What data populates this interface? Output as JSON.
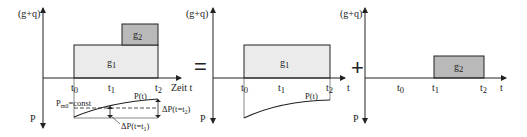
{
  "colors": {
    "g1_fill": "#ebebeb",
    "g2_fill": "#b9b9b9",
    "stroke": "#222222"
  },
  "operators": {
    "equals": "=",
    "plus": "+"
  },
  "panels": [
    {
      "id": "left",
      "y_label_top": "(g+q)",
      "y_label_bottom": "P",
      "x_label": "Zeit t",
      "ticks": {
        "t0": "t",
        "t0_sub": "0",
        "t1": "t",
        "t1_sub": "1",
        "t2": "t",
        "t2_sub": "2"
      },
      "boxes": {
        "g1": "g",
        "g1_sub": "1",
        "g2": "g",
        "g2_sub": "2"
      },
      "prestress": {
        "curve_label": "P(t)",
        "const_label": "P",
        "const_sub": "m0",
        "const_suffix": "=const",
        "delta_t2": "ΔP(t=t",
        "delta_t2_sub": "2",
        "delta_t2_end": ")",
        "delta_t1": "ΔP(t=t",
        "delta_t1_sub": "1",
        "delta_t1_end": ")"
      }
    },
    {
      "id": "middle",
      "y_label_top": "(g+q)",
      "y_label_bottom": "P",
      "x_label": "t",
      "ticks": {
        "t0": "t",
        "t0_sub": "0",
        "t1": "t",
        "t1_sub": "1",
        "t2": "t",
        "t2_sub": "2"
      },
      "boxes": {
        "g1": "g",
        "g1_sub": "1"
      },
      "prestress": {
        "curve_label": "P(t)"
      }
    },
    {
      "id": "right",
      "y_label_top": "(g+q)",
      "y_label_bottom": "P",
      "x_label": "t",
      "ticks": {
        "t0": "t",
        "t0_sub": "0",
        "t1": "t",
        "t1_sub": "1",
        "t2": "t",
        "t2_sub": "2"
      },
      "boxes": {
        "g2": "g",
        "g2_sub": "2"
      }
    }
  ]
}
